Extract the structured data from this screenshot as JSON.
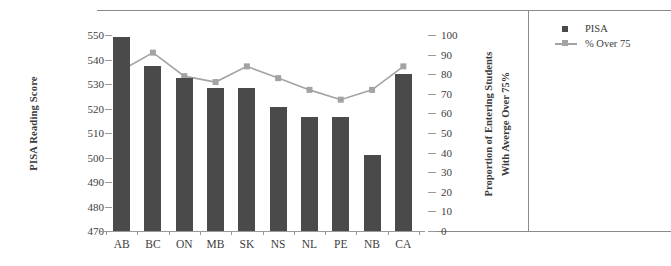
{
  "chart_data": {
    "type": "bar",
    "title": "",
    "xlabel": "",
    "ylabel": "PISA Reading Score",
    "y2label": "Proportion of Entering Students With Averge Over 75%",
    "y2label_line1": "Proportion of Entering Students",
    "y2label_line2": "With Averge Over 75%",
    "categories": [
      "AB",
      "BC",
      "ON",
      "MB",
      "SK",
      "NS",
      "NL",
      "PE",
      "NB",
      "CA"
    ],
    "ylim": [
      470,
      550
    ],
    "yticks": [
      470,
      480,
      490,
      500,
      510,
      520,
      530,
      540,
      550
    ],
    "y2lim": [
      0,
      100
    ],
    "y2ticks": [
      0,
      10,
      20,
      30,
      40,
      50,
      60,
      70,
      80,
      90,
      100
    ],
    "grid": false,
    "legend_position": "right-panel",
    "series": [
      {
        "name": "PISA",
        "type": "bar",
        "axis": "left",
        "color": "#4a4a4a",
        "values": [
          549,
          537.5,
          532.5,
          528.5,
          528.5,
          520.5,
          516.5,
          516.5,
          501,
          534
        ]
      },
      {
        "name": "% Over 75",
        "type": "line",
        "axis": "right",
        "color": "#a3a3a3",
        "values": [
          82,
          91,
          79,
          76,
          84,
          78,
          72,
          67,
          72,
          84
        ]
      }
    ]
  },
  "legend": {
    "items": [
      {
        "label": "PISA",
        "marker": "square",
        "color": "#4a4a4a"
      },
      {
        "label": "% Over 75",
        "marker": "line-square",
        "color": "#a3a3a3"
      }
    ]
  },
  "colors": {
    "bar": "#4a4a4a",
    "line": "#a3a3a3",
    "axis": "#9a9a9a",
    "rule": "#8a8a8a",
    "text": "#3d3d3d",
    "background": "#ffffff"
  }
}
